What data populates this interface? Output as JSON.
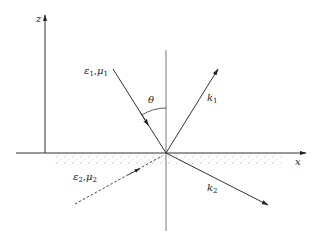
{
  "diagram": {
    "type": "reflection-refraction-at-interface",
    "axes": {
      "z_label": "z",
      "x_label": "x"
    },
    "angle_label": "θ",
    "media": {
      "upper": {
        "eps": "ε",
        "eps_sub": "1",
        "sep": ",",
        "mu": "μ",
        "mu_sub": "1"
      },
      "lower": {
        "eps": "ε",
        "eps_sub": "2",
        "sep": ",",
        "mu": "μ",
        "mu_sub": "2"
      }
    },
    "wave_vectors": {
      "reflected": {
        "k": "k",
        "sub": "1"
      },
      "transmitted": {
        "k": "k",
        "sub": "2"
      }
    },
    "colors": {
      "line": "#333333",
      "stipple": "#888888",
      "background": "#ffffff"
    }
  }
}
